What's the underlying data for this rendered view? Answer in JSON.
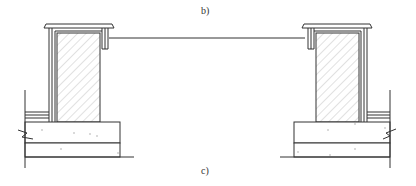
{
  "figure": {
    "labels": {
      "top": "b)",
      "bottom": "c)"
    },
    "colors": {
      "line": "#333333",
      "hatch": "#bbbbbb",
      "background": "#ffffff",
      "aggregate": "#aaaaaa"
    },
    "elements": {
      "left_section": "wall-section-left",
      "right_section": "wall-section-right",
      "span_line": "connecting-beam-line"
    }
  }
}
